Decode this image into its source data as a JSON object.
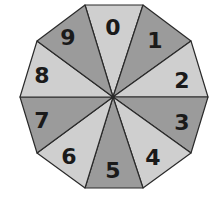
{
  "spinner": {
    "shape": "decagon",
    "center": [
      113,
      97
    ],
    "colors": {
      "light": "#cfcfcf",
      "dark": "#9b9b9b",
      "outline": "#2a2a2a",
      "text": "#1a1a1a"
    },
    "vertices": [
      [
        85,
        5
      ],
      [
        143,
        5
      ],
      [
        191,
        41
      ],
      [
        208,
        97
      ],
      [
        191,
        153
      ],
      [
        143,
        188
      ],
      [
        85,
        188
      ],
      [
        37,
        153
      ],
      [
        20,
        97
      ],
      [
        37,
        41
      ]
    ],
    "sectors": [
      {
        "label": "0",
        "shade": "light",
        "label_pos": [
          113,
          27
        ]
      },
      {
        "label": "1",
        "shade": "dark",
        "label_pos": [
          155,
          40
        ]
      },
      {
        "label": "2",
        "shade": "light",
        "label_pos": [
          182,
          80
        ]
      },
      {
        "label": "3",
        "shade": "dark",
        "label_pos": [
          182,
          122
        ]
      },
      {
        "label": "4",
        "shade": "light",
        "label_pos": [
          153,
          157
        ]
      },
      {
        "label": "5",
        "shade": "dark",
        "label_pos": [
          113,
          170
        ]
      },
      {
        "label": "6",
        "shade": "light",
        "label_pos": [
          69,
          156
        ]
      },
      {
        "label": "7",
        "shade": "dark",
        "label_pos": [
          42,
          120
        ]
      },
      {
        "label": "8",
        "shade": "light",
        "label_pos": [
          42,
          75
        ]
      },
      {
        "label": "9",
        "shade": "dark",
        "label_pos": [
          68,
          37
        ]
      }
    ]
  }
}
